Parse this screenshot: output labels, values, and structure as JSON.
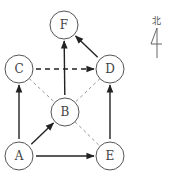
{
  "diagram": {
    "nodes": [
      {
        "id": "F",
        "label": "F",
        "x": 64,
        "y": 25
      },
      {
        "id": "C",
        "label": "C",
        "x": 19,
        "y": 69
      },
      {
        "id": "D",
        "label": "D",
        "x": 110,
        "y": 69
      },
      {
        "id": "B",
        "label": "B",
        "x": 65,
        "y": 112
      },
      {
        "id": "A",
        "label": "A",
        "x": 19,
        "y": 156
      },
      {
        "id": "E",
        "label": "E",
        "x": 110,
        "y": 156
      }
    ],
    "node_radius": 14,
    "edges": [
      {
        "from": "A",
        "to": "C",
        "style": "solid",
        "arrow": true
      },
      {
        "from": "A",
        "to": "B",
        "style": "solid",
        "arrow": true
      },
      {
        "from": "A",
        "to": "E",
        "style": "solid",
        "arrow": true
      },
      {
        "from": "E",
        "to": "D",
        "style": "solid",
        "arrow": true
      },
      {
        "from": "B",
        "to": "F",
        "style": "solid",
        "arrow": true
      },
      {
        "from": "D",
        "to": "F",
        "style": "solid",
        "arrow": true
      },
      {
        "from": "C",
        "to": "D",
        "style": "dashed",
        "arrow": true
      },
      {
        "from": "C",
        "to": "B",
        "style": "thin",
        "arrow": false
      },
      {
        "from": "D",
        "to": "B",
        "style": "thin",
        "arrow": false
      },
      {
        "from": "B",
        "to": "E",
        "style": "thin",
        "arrow": false
      }
    ],
    "compass": {
      "label": "北",
      "symbol": "north-arrow"
    }
  }
}
